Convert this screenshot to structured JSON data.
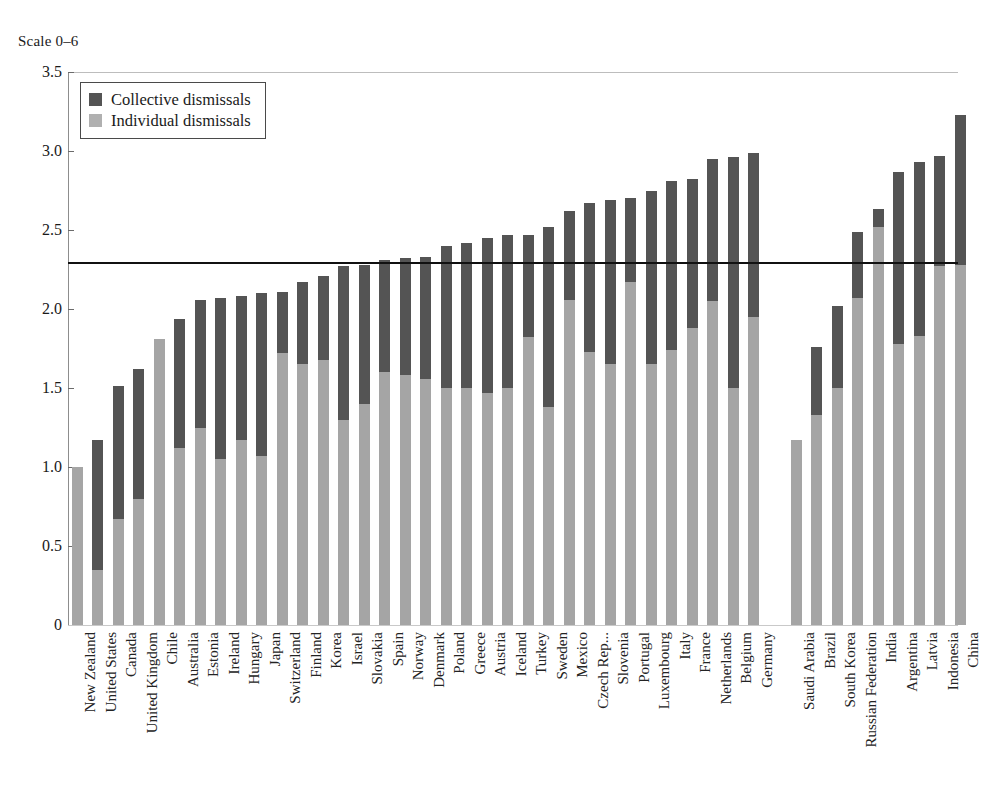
{
  "scale_caption": "Scale 0–6",
  "legend": {
    "position": "inside-top-left",
    "items": [
      {
        "label": "Collective dismissals",
        "color": "#545454",
        "key": "collective"
      },
      {
        "label": "Individual dismissals",
        "color": "#b0b0b0",
        "key": "individual"
      }
    ]
  },
  "chart_data": {
    "type": "bar",
    "stacked": true,
    "title": "",
    "subtitle": "",
    "xlabel": "",
    "ylabel": "",
    "ylim": [
      0,
      3.5
    ],
    "yticks": [
      "0",
      "0.5",
      "1.0",
      "1.5",
      "2.0",
      "2.5",
      "3.0",
      "3.5"
    ],
    "ytick_values": [
      0,
      0.5,
      1.0,
      1.5,
      2.0,
      2.5,
      3.0,
      3.5
    ],
    "grid": false,
    "legend_position": "inside-top-left",
    "annotations": [
      {
        "type": "horizontal-line",
        "name": "average-reference-line",
        "value": 2.29,
        "color": "#111111"
      }
    ],
    "group_gap_after_index": 33,
    "categories": [
      "New Zealand",
      "United States",
      "Canada",
      "United Kingdom",
      "Chile",
      "Australia",
      "Estonia",
      "Ireland",
      "Hungary",
      "Japan",
      "Switzerland",
      "Finland",
      "Korea",
      "Israel",
      "Slovakia",
      "Spain",
      "Norway",
      "Denmark",
      "Poland",
      "Greece",
      "Austria",
      "Iceland",
      "Turkey",
      "Sweden",
      "Mexico",
      "Czech Rep...",
      "Slovenia",
      "Portugal",
      "Luxembourg",
      "Italy",
      "France",
      "Netherlands",
      "Belgium",
      "Germany",
      "Saudi Arabia",
      "Brazil",
      "South Korea",
      "Russian Federation",
      "India",
      "Argentina",
      "Latvia",
      "Indonesia",
      "China"
    ],
    "series": [
      {
        "name": "Individual dismissals",
        "color": "#a5a5a5",
        "values": [
          1.0,
          0.35,
          0.67,
          0.8,
          1.81,
          1.12,
          1.25,
          1.05,
          1.17,
          1.07,
          1.72,
          1.65,
          1.68,
          1.3,
          1.4,
          1.6,
          1.58,
          1.56,
          1.5,
          1.5,
          1.47,
          1.5,
          1.82,
          1.38,
          2.06,
          1.73,
          1.65,
          2.17,
          1.65,
          1.74,
          1.88,
          2.05,
          1.5,
          1.95,
          1.17,
          1.33,
          1.5,
          2.07,
          2.52,
          1.78,
          1.83,
          2.27,
          2.28
        ]
      },
      {
        "name": "Collective dismissals",
        "color": "#545454",
        "values": [
          0.0,
          0.82,
          0.84,
          0.82,
          0.0,
          0.82,
          0.81,
          1.02,
          0.91,
          1.03,
          0.39,
          0.52,
          0.53,
          0.97,
          0.88,
          0.71,
          0.74,
          0.77,
          0.9,
          0.92,
          0.98,
          0.97,
          0.65,
          1.14,
          0.56,
          0.94,
          1.04,
          0.53,
          1.1,
          1.07,
          0.94,
          0.9,
          1.46,
          1.04,
          0.0,
          0.43,
          0.52,
          0.42,
          0.11,
          1.09,
          1.1,
          0.7,
          0.95
        ]
      }
    ],
    "totals": [
      1.0,
      1.17,
      1.51,
      1.62,
      1.81,
      1.94,
      2.06,
      2.07,
      2.08,
      2.1,
      2.11,
      2.17,
      2.21,
      2.27,
      2.28,
      2.31,
      2.32,
      2.33,
      2.4,
      2.42,
      2.45,
      2.47,
      2.47,
      2.52,
      2.62,
      2.67,
      2.69,
      2.7,
      2.75,
      2.81,
      2.82,
      2.95,
      2.96,
      2.99,
      1.17,
      1.76,
      2.02,
      2.49,
      2.63,
      2.87,
      2.93,
      2.97,
      3.23
    ]
  },
  "geometry": {
    "plot_left": 68,
    "plot_right": 958,
    "plot_top": 72,
    "plot_bottom": 625,
    "bar_width": 11,
    "bar_pitch": 20.5,
    "group_gap": 22,
    "first_bar_center": 77
  }
}
